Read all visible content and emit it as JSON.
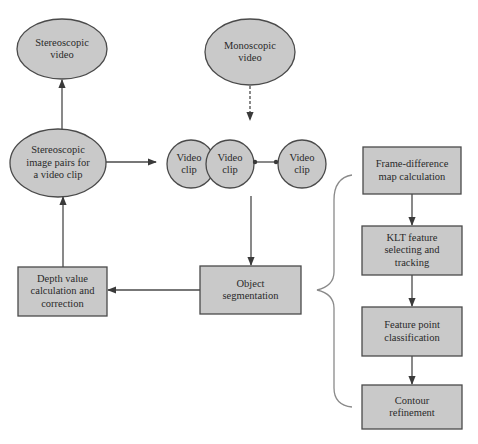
{
  "diagram": {
    "colors": {
      "fill": "#c9c9c9",
      "stroke": "#4a4a4a",
      "text": "#2a2a2a",
      "background": "#ffffff",
      "brace": "#8a8a8a"
    },
    "nodes": {
      "stereoscopic_video": {
        "label": "Stereoscopic\nvideo",
        "shape": "ellipse"
      },
      "monoscopic_video": {
        "label": "Monoscopic\nvideo",
        "shape": "ellipse"
      },
      "stereo_image_pairs": {
        "label": "Stereoscopic\nimage pairs for\na video clip",
        "shape": "ellipse"
      },
      "video_clip_1": {
        "label": "Video\nclip",
        "shape": "circle"
      },
      "video_clip_2": {
        "label": "Video\nclip",
        "shape": "circle"
      },
      "video_clip_3": {
        "label": "Video\nclip",
        "shape": "circle"
      },
      "object_segmentation": {
        "label": "Object\nsegmentation",
        "shape": "rect"
      },
      "depth_value": {
        "label": "Depth value\ncalculation and\ncorrection",
        "shape": "rect"
      },
      "frame_difference": {
        "label": "Frame-difference\nmap calculation",
        "shape": "rect"
      },
      "klt_feature": {
        "label": "KLT feature\nselecting and\ntracking",
        "shape": "rect"
      },
      "feature_point": {
        "label": "Feature point\nclassification",
        "shape": "rect"
      },
      "contour_refinement": {
        "label": "Contour\nrefinement",
        "shape": "rect"
      }
    },
    "edges": [
      {
        "from": "monoscopic_video",
        "to": "video_clip_2",
        "style": "dashed-arrow"
      },
      {
        "from": "stereo_image_pairs",
        "to": "video_clip_1",
        "style": "arrow"
      },
      {
        "from": "stereo_image_pairs",
        "to": "stereoscopic_video",
        "style": "arrow"
      },
      {
        "from": "video_clip_2",
        "to": "video_clip_3",
        "style": "dot-line"
      },
      {
        "from": "video_clip_2",
        "to": "object_segmentation",
        "style": "arrow"
      },
      {
        "from": "object_segmentation",
        "to": "depth_value",
        "style": "arrow"
      },
      {
        "from": "depth_value",
        "to": "stereo_image_pairs",
        "style": "arrow"
      },
      {
        "from": "frame_difference",
        "to": "klt_feature",
        "style": "arrow"
      },
      {
        "from": "klt_feature",
        "to": "feature_point",
        "style": "arrow"
      },
      {
        "from": "feature_point",
        "to": "contour_refinement",
        "style": "arrow"
      }
    ],
    "groups": [
      {
        "type": "brace",
        "points_to": "object_segmentation",
        "contains": [
          "frame_difference",
          "klt_feature",
          "feature_point",
          "contour_refinement"
        ]
      }
    ]
  }
}
